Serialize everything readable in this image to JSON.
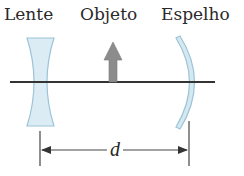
{
  "diagram": {
    "labels": {
      "lens": "Lente",
      "object": "Objeto",
      "mirror": "Espelho",
      "distance": "d"
    },
    "elements": [
      {
        "type": "concave-lens",
        "label": "Lente"
      },
      {
        "type": "object-arrow",
        "label": "Objeto",
        "direction": "up"
      },
      {
        "type": "concave-mirror",
        "label": "Espelho"
      },
      {
        "type": "dimension-line",
        "label": "d",
        "from": "Lente",
        "to": "Espelho"
      }
    ],
    "colors": {
      "lens_fill": "#dcecf4",
      "lens_stroke": "#9cc4d8",
      "mirror_fill": "#d4e8f0",
      "mirror_stroke": "#9cc4d8",
      "arrow_fill": "#8c8c8c",
      "axis": "#333333",
      "text": "#2a2a2a"
    }
  }
}
